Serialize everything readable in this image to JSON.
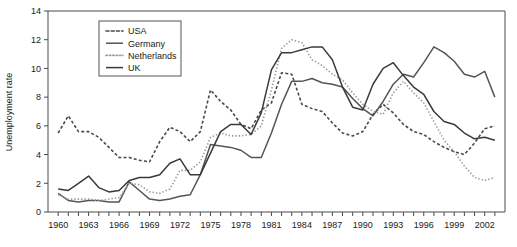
{
  "chart_data": {
    "type": "line",
    "title": "",
    "xlabel": "",
    "ylabel": "Unemployment rate",
    "xlim": [
      1959,
      2004
    ],
    "ylim": [
      0,
      14
    ],
    "yticks": [
      0,
      2,
      4,
      6,
      8,
      10,
      12,
      14
    ],
    "xticks": [
      1960,
      1961,
      1962,
      1963,
      1964,
      1965,
      1966,
      1967,
      1968,
      1969,
      1970,
      1971,
      1972,
      1973,
      1974,
      1975,
      1976,
      1977,
      1978,
      1979,
      1980,
      1981,
      1982,
      1983,
      1984,
      1985,
      1986,
      1987,
      1988,
      1989,
      1990,
      1991,
      1992,
      1993,
      1994,
      1995,
      1996,
      1997,
      1998,
      1999,
      2000,
      2001,
      2002,
      2003
    ],
    "xtick_labels": [
      1960,
      1963,
      1966,
      1969,
      1972,
      1975,
      1978,
      1981,
      1984,
      1987,
      1990,
      1993,
      1996,
      1999,
      2002
    ],
    "grid": false,
    "legend_position": "top-center",
    "x": [
      1960,
      1961,
      1962,
      1963,
      1964,
      1965,
      1966,
      1967,
      1968,
      1969,
      1970,
      1971,
      1972,
      1973,
      1974,
      1975,
      1976,
      1977,
      1978,
      1979,
      1980,
      1981,
      1982,
      1983,
      1984,
      1985,
      1986,
      1987,
      1988,
      1989,
      1990,
      1991,
      1992,
      1993,
      1994,
      1995,
      1996,
      1997,
      1998,
      1999,
      2000,
      2001,
      2002,
      2003
    ],
    "series": [
      {
        "name": "USA",
        "style": "dashed",
        "color": "#4a4a4a",
        "values": [
          5.5,
          6.7,
          5.6,
          5.6,
          5.2,
          4.5,
          3.8,
          3.8,
          3.6,
          3.5,
          4.9,
          5.9,
          5.6,
          4.9,
          5.6,
          8.5,
          7.7,
          7.1,
          6.1,
          5.8,
          7.1,
          7.6,
          9.7,
          9.6,
          7.5,
          7.2,
          7.0,
          6.2,
          5.5,
          5.3,
          5.6,
          6.8,
          7.5,
          6.9,
          6.1,
          5.6,
          5.4,
          4.9,
          4.5,
          4.2,
          4.0,
          4.8,
          5.8,
          6.0
        ]
      },
      {
        "name": "Germany",
        "style": "solid",
        "color": "#555555",
        "values": [
          1.3,
          0.8,
          0.7,
          0.8,
          0.8,
          0.7,
          0.7,
          2.1,
          1.5,
          0.9,
          0.8,
          0.9,
          1.1,
          1.2,
          2.6,
          4.7,
          4.6,
          4.5,
          4.3,
          3.8,
          3.8,
          5.5,
          7.5,
          9.1,
          9.1,
          9.3,
          9.0,
          8.9,
          8.7,
          7.9,
          7.2,
          6.7,
          7.7,
          8.9,
          9.6,
          9.4,
          10.4,
          11.5,
          11.1,
          10.5,
          9.6,
          9.4,
          9.8,
          8.0
        ]
      },
      {
        "name": "Netherlands",
        "style": "dotted",
        "color": "#9a9a9a",
        "values": [
          1.2,
          0.9,
          0.9,
          0.9,
          0.8,
          0.9,
          1.0,
          2.0,
          1.9,
          1.4,
          1.3,
          1.6,
          2.9,
          2.9,
          3.5,
          5.2,
          5.5,
          5.3,
          5.3,
          5.4,
          6.0,
          8.5,
          11.4,
          12.0,
          11.8,
          10.6,
          10.2,
          9.6,
          9.2,
          8.3,
          7.5,
          7.0,
          6.8,
          8.3,
          9.1,
          8.3,
          7.6,
          6.3,
          5.0,
          4.2,
          3.2,
          2.4,
          2.2,
          2.4
        ]
      },
      {
        "name": "UK",
        "style": "solid",
        "color": "#3a3a3a",
        "values": [
          1.6,
          1.5,
          2.0,
          2.5,
          1.7,
          1.4,
          1.5,
          2.2,
          2.4,
          2.4,
          2.6,
          3.4,
          3.7,
          2.6,
          2.6,
          4.1,
          5.6,
          6.1,
          6.1,
          5.4,
          6.9,
          9.9,
          11.1,
          11.1,
          11.3,
          11.5,
          11.5,
          10.6,
          8.7,
          7.3,
          7.1,
          8.9,
          10.0,
          10.4,
          9.5,
          8.7,
          8.2,
          7.0,
          6.3,
          6.1,
          5.5,
          5.1,
          5.2,
          5.0
        ]
      }
    ]
  },
  "axis": {
    "y_title": "Unemployment rate"
  },
  "legend": {
    "entries": [
      {
        "label": "USA"
      },
      {
        "label": "Germany"
      },
      {
        "label": "Netherlands"
      },
      {
        "label": "UK"
      }
    ]
  }
}
